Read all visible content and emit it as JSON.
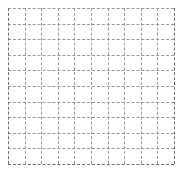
{
  "figure": {
    "background_color": "#ffffff",
    "grid_color": "#9a9a9a",
    "edge_color": "#6f6f6f",
    "title": "",
    "xlabel": "",
    "ylabel": ""
  },
  "chart_data": {
    "type": "line",
    "title": "",
    "subtitle": "",
    "xlabel": "",
    "ylabel": "",
    "series": [],
    "x": [],
    "categories": [],
    "values": [],
    "xlim": [
      0,
      10
    ],
    "ylim": [
      0,
      10
    ],
    "xticks": [
      0,
      1,
      2,
      3,
      4,
      5,
      6,
      7,
      8,
      9,
      10
    ],
    "yticks": [
      0,
      1,
      2,
      3,
      4,
      5,
      6,
      7,
      8,
      9,
      10
    ],
    "xticklabels": [],
    "yticklabels": [],
    "grid": true,
    "grid_linestyle": "dashed",
    "legend": false,
    "legend_position": "none",
    "annotations": []
  },
  "gridlines": {
    "vertical_positions_px": [
      0,
      16.6,
      33.2,
      49.8,
      66.4,
      83.0,
      99.6,
      116.2,
      132.8,
      149.4,
      166
    ],
    "horizontal_positions_px": [
      0,
      15.6,
      31.2,
      46.8,
      62.4,
      78.0,
      93.6,
      109.2,
      124.8,
      140.4,
      156
    ],
    "column_count": 10,
    "row_count": 10
  }
}
